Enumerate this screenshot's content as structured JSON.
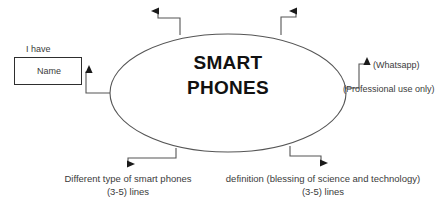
{
  "diagram": {
    "type": "mind-map",
    "center": {
      "shape": "ellipse",
      "label": "SMART PHONES"
    },
    "branches": [
      {
        "id": "name",
        "direction": "left",
        "caption": "I have",
        "box_text": "Name",
        "arrow": "left"
      },
      {
        "id": "top-left",
        "direction": "up",
        "label": "",
        "arrow": "up"
      },
      {
        "id": "top-right",
        "direction": "up",
        "label": "",
        "arrow": "up"
      },
      {
        "id": "whatsapp",
        "direction": "right",
        "label": "(Whatsapp)",
        "arrow": "right"
      },
      {
        "id": "professional",
        "direction": "right",
        "label": "(Professional use only)",
        "arrow": "none"
      },
      {
        "id": "types",
        "direction": "down",
        "label_line1": "Different type of smart phones",
        "label_line2": "(3-5) lines",
        "arrow": "down"
      },
      {
        "id": "definition",
        "direction": "down",
        "label_line1": "definition (blessing of science and technology)",
        "label_line2": "(3-5) lines",
        "arrow": "down"
      }
    ],
    "colors": {
      "stroke": "#555555",
      "arrow": "#1a1a1a",
      "text": "#3b3b3b",
      "center_text": "#111111",
      "box_border": "#2e2e2e",
      "background": "#ffffff"
    }
  }
}
